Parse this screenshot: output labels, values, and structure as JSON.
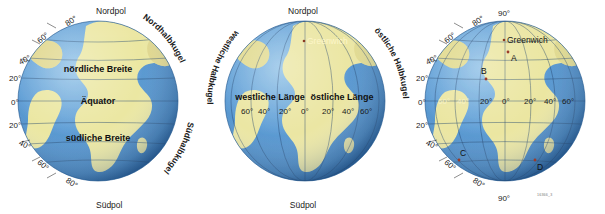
{
  "figure": {
    "watermark": "16366_3",
    "colors": {
      "ocean": "#5f9ed4",
      "ocean_dark": "#2f6ba4",
      "ocean_light": "#8dc0e6",
      "land": "#ece7a3",
      "land_shade": "#d8cd7c",
      "graticule": "#24486e",
      "text": "#1a1a1a",
      "marker": "#9c3b2a",
      "background": "#ffffff"
    }
  },
  "globes": [
    {
      "id": "latitude-globe",
      "name": "Breitenkreise",
      "pole_labels": {
        "north": "Nordpol",
        "south": "Südpol"
      },
      "zone_labels": [
        {
          "text": "nördliche Breite"
        },
        {
          "text": "Äquator"
        },
        {
          "text": "südliche Breite"
        }
      ],
      "hemisphere_labels": [
        {
          "text": "Nordhalbkugel"
        },
        {
          "text": "Südhalbkugel"
        }
      ],
      "latitude_ticks": [
        {
          "label": "80°",
          "value": 80
        },
        {
          "label": "60°",
          "value": 60
        },
        {
          "label": "40°",
          "value": 40
        },
        {
          "label": "20°",
          "value": 20
        },
        {
          "label": "0°",
          "value": 0
        },
        {
          "label": "20°",
          "value": -20
        },
        {
          "label": "40°",
          "value": -40
        },
        {
          "label": "60°",
          "value": -60
        },
        {
          "label": "80°",
          "value": -80
        }
      ]
    },
    {
      "id": "longitude-globe",
      "name": "Längenkreise",
      "pole_labels": {
        "north": "Nordpol",
        "south": "Südpol"
      },
      "place_labels": [
        {
          "text": "Greenwich"
        }
      ],
      "zone_labels": [
        {
          "text": "westliche Länge"
        },
        {
          "text": "östliche Länge"
        }
      ],
      "hemisphere_labels": [
        {
          "text": "westliche Halbkugel"
        },
        {
          "text": "östliche Halbkugel"
        }
      ],
      "longitude_ticks": [
        {
          "label": "60°",
          "value": -60
        },
        {
          "label": "40°",
          "value": -40
        },
        {
          "label": "20°",
          "value": -20
        },
        {
          "label": "0°",
          "value": 0
        },
        {
          "label": "20°",
          "value": 20
        },
        {
          "label": "40°",
          "value": 40
        },
        {
          "label": "60°",
          "value": 60
        }
      ]
    },
    {
      "id": "grid-globe",
      "name": "Gradnetz mit Punkten",
      "pole_labels": {
        "north": "90°",
        "south": "90°"
      },
      "place_labels": [
        {
          "text": "Greenwich"
        }
      ],
      "latitude_ticks": [
        {
          "label": "80°",
          "value": 80
        },
        {
          "label": "60°",
          "value": 60
        },
        {
          "label": "40°",
          "value": 40
        },
        {
          "label": "20°",
          "value": 20
        },
        {
          "label": "0°",
          "value": 0
        },
        {
          "label": "20°",
          "value": -20
        },
        {
          "label": "40°",
          "value": -40
        },
        {
          "label": "60°",
          "value": -60
        },
        {
          "label": "80°",
          "value": -80
        }
      ],
      "longitude_ticks": [
        {
          "label": "60°",
          "value": -60
        },
        {
          "label": "40°",
          "value": -40
        },
        {
          "label": "20°",
          "value": -20
        },
        {
          "label": "0°",
          "value": 0
        },
        {
          "label": "20°",
          "value": 20
        },
        {
          "label": "40°",
          "value": 40
        },
        {
          "label": "60°",
          "value": 60
        }
      ],
      "points": [
        {
          "label": "A",
          "lon": 10,
          "lat": 35
        },
        {
          "label": "B",
          "lon": -15,
          "lat": 15
        },
        {
          "label": "C",
          "lon": -40,
          "lat": -35
        },
        {
          "label": "D",
          "lon": 20,
          "lat": -35
        }
      ]
    }
  ]
}
